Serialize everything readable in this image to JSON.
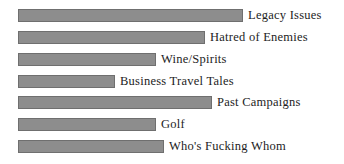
{
  "chart_data": {
    "type": "bar",
    "orientation": "horizontal",
    "title": "",
    "subtitle": "",
    "xlabel": "",
    "ylabel": "",
    "grid": false,
    "legend": false,
    "axis_visible": false,
    "categories": [
      "Legacy Issues",
      "Hatred of Enemies",
      "Wine/Spirits",
      "Business Travel Tales",
      "Past Campaigns",
      "Golf",
      "Who's Fucking Whom"
    ],
    "values": [
      100,
      83,
      61,
      43,
      86,
      61,
      64
    ],
    "xlim": [
      0,
      100
    ],
    "labels_position": "end-of-bar",
    "bar_color": "#8d8d8d",
    "bar_border_color": "#6f6f6f",
    "text_color": "#1d1d1d",
    "background_color": "#ffffff"
  },
  "bars": [
    {
      "label": "Legacy Issues",
      "value": 100,
      "bar_start_px": 18,
      "bar_end_px": 243,
      "top_px": 9,
      "label_x_px": 248
    },
    {
      "label": "Hatred of Enemies",
      "value": 83,
      "bar_start_px": 18,
      "bar_end_px": 205,
      "top_px": 31,
      "label_x_px": 210
    },
    {
      "label": "Wine/Spirits",
      "value": 61,
      "bar_start_px": 18,
      "bar_end_px": 156,
      "top_px": 53,
      "label_x_px": 161
    },
    {
      "label": "Business Travel Tales",
      "value": 43,
      "bar_start_px": 18,
      "bar_end_px": 115,
      "top_px": 75,
      "label_x_px": 120
    },
    {
      "label": "Past Campaigns",
      "value": 86,
      "bar_start_px": 18,
      "bar_end_px": 212,
      "top_px": 96,
      "label_x_px": 217
    },
    {
      "label": "Golf",
      "value": 61,
      "bar_start_px": 18,
      "bar_end_px": 156,
      "top_px": 118,
      "label_x_px": 161
    },
    {
      "label": "Who's Fucking Whom",
      "value": 64,
      "bar_start_px": 18,
      "bar_end_px": 164,
      "top_px": 140,
      "label_x_px": 169
    }
  ]
}
